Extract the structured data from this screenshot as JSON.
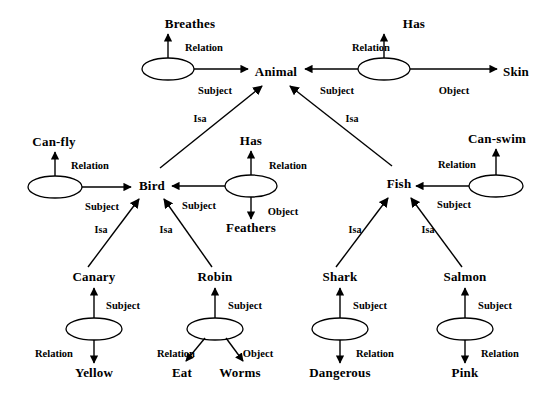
{
  "diagram": {
    "background_color": "#ffffff",
    "stroke_color": "#000000",
    "concepts": [
      {
        "id": "breathes",
        "label": "Breathes",
        "x": 190,
        "y": 24
      },
      {
        "id": "has_top",
        "label": "Has",
        "x": 414,
        "y": 24
      },
      {
        "id": "animal",
        "label": "Animal",
        "x": 276,
        "y": 72
      },
      {
        "id": "skin",
        "label": "Skin",
        "x": 516,
        "y": 72
      },
      {
        "id": "can_fly",
        "label": "Can-fly",
        "x": 54,
        "y": 142
      },
      {
        "id": "has_mid",
        "label": "Has",
        "x": 251,
        "y": 141
      },
      {
        "id": "can_swim",
        "label": "Can-swim",
        "x": 497,
        "y": 139
      },
      {
        "id": "bird",
        "label": "Bird",
        "x": 152,
        "y": 186
      },
      {
        "id": "fish",
        "label": "Fish",
        "x": 399,
        "y": 184
      },
      {
        "id": "feathers",
        "label": "Feathers",
        "x": 251,
        "y": 228
      },
      {
        "id": "canary",
        "label": "Canary",
        "x": 94,
        "y": 277
      },
      {
        "id": "robin",
        "label": "Robin",
        "x": 215,
        "y": 277
      },
      {
        "id": "shark",
        "label": "Shark",
        "x": 340,
        "y": 277
      },
      {
        "id": "salmon",
        "label": "Salmon",
        "x": 465,
        "y": 277
      },
      {
        "id": "yellow",
        "label": "Yellow",
        "x": 94,
        "y": 373
      },
      {
        "id": "eat",
        "label": "Eat",
        "x": 182,
        "y": 373
      },
      {
        "id": "worms",
        "label": "Worms",
        "x": 240,
        "y": 373
      },
      {
        "id": "dangerous",
        "label": "Dangerous",
        "x": 340,
        "y": 373
      },
      {
        "id": "pink",
        "label": "Pink",
        "x": 465,
        "y": 373
      }
    ],
    "relation_nodes": [
      {
        "id": "rn-breathes",
        "cx": 168,
        "cy": 69,
        "rx": 26,
        "ry": 11
      },
      {
        "id": "rn-has-skin",
        "cx": 384,
        "cy": 69,
        "rx": 26,
        "ry": 11
      },
      {
        "id": "rn-canfly",
        "cx": 55,
        "cy": 187,
        "rx": 27,
        "ry": 11
      },
      {
        "id": "rn-feathers",
        "cx": 251,
        "cy": 186,
        "rx": 26,
        "ry": 11
      },
      {
        "id": "rn-canswim",
        "cx": 496,
        "cy": 186,
        "rx": 27,
        "ry": 11
      },
      {
        "id": "rn-yellow",
        "cx": 94,
        "cy": 329,
        "rx": 28,
        "ry": 11
      },
      {
        "id": "rn-robin",
        "cx": 215,
        "cy": 329,
        "rx": 28,
        "ry": 11
      },
      {
        "id": "rn-shark",
        "cx": 340,
        "cy": 329,
        "rx": 28,
        "ry": 11
      },
      {
        "id": "rn-salmon",
        "cx": 465,
        "cy": 329,
        "rx": 28,
        "ry": 11
      }
    ],
    "edge_labels": [
      {
        "id": "el-1",
        "text": "Relation",
        "x": 204,
        "y": 47
      },
      {
        "id": "el-2",
        "text": "Subject",
        "x": 215,
        "y": 90
      },
      {
        "id": "el-3",
        "text": "Relation",
        "x": 371,
        "y": 47
      },
      {
        "id": "el-4",
        "text": "Subject",
        "x": 337,
        "y": 90
      },
      {
        "id": "el-5",
        "text": "Object",
        "x": 454,
        "y": 90
      },
      {
        "id": "el-6",
        "text": "Isa",
        "x": 200,
        "y": 118
      },
      {
        "id": "el-7",
        "text": "Isa",
        "x": 352,
        "y": 118
      },
      {
        "id": "el-8",
        "text": "Relation",
        "x": 90,
        "y": 165
      },
      {
        "id": "el-9",
        "text": "Subject",
        "x": 102,
        "y": 206
      },
      {
        "id": "el-10",
        "text": "Relation",
        "x": 288,
        "y": 165
      },
      {
        "id": "el-11",
        "text": "Subject",
        "x": 199,
        "y": 205
      },
      {
        "id": "el-12",
        "text": "Object",
        "x": 283,
        "y": 211
      },
      {
        "id": "el-13",
        "text": "Relation",
        "x": 457,
        "y": 164
      },
      {
        "id": "el-14",
        "text": "Subject",
        "x": 454,
        "y": 204
      },
      {
        "id": "el-15",
        "text": "Isa",
        "x": 101,
        "y": 229
      },
      {
        "id": "el-16",
        "text": "Isa",
        "x": 166,
        "y": 229
      },
      {
        "id": "el-17",
        "text": "Isa",
        "x": 355,
        "y": 229
      },
      {
        "id": "el-18",
        "text": "Isa",
        "x": 428,
        "y": 229
      },
      {
        "id": "el-19",
        "text": "Subject",
        "x": 123,
        "y": 305
      },
      {
        "id": "el-20",
        "text": "Relation",
        "x": 54,
        "y": 353
      },
      {
        "id": "el-21",
        "text": "Subject",
        "x": 245,
        "y": 305
      },
      {
        "id": "el-22",
        "text": "Relation",
        "x": 176,
        "y": 353
      },
      {
        "id": "el-23",
        "text": "Object",
        "x": 258,
        "y": 353
      },
      {
        "id": "el-24",
        "text": "Subject",
        "x": 370,
        "y": 305
      },
      {
        "id": "el-25",
        "text": "Relation",
        "x": 375,
        "y": 353
      },
      {
        "id": "el-26",
        "text": "Subject",
        "x": 495,
        "y": 305
      },
      {
        "id": "el-27",
        "text": "Relation",
        "x": 500,
        "y": 353
      }
    ]
  }
}
